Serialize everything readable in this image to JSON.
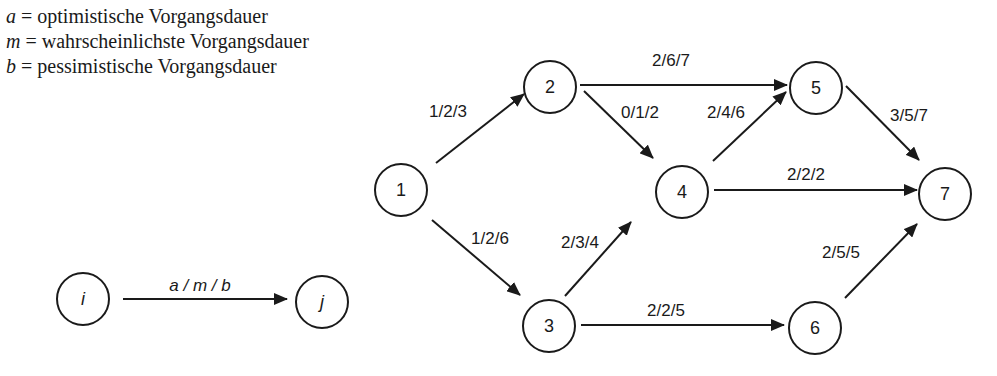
{
  "legend": [
    {
      "var": "a",
      "text": " = optimistische Vorgangsdauer"
    },
    {
      "var": "m",
      "text": " = wahrscheinlichste Vorgangsdauer"
    },
    {
      "var": "b",
      "text": " = pessimistische Vorgangsdauer"
    }
  ],
  "key": {
    "from": "i",
    "to": "j",
    "label": "a / m / b"
  },
  "nodes": [
    {
      "id": "1",
      "label": "1"
    },
    {
      "id": "2",
      "label": "2"
    },
    {
      "id": "3",
      "label": "3"
    },
    {
      "id": "4",
      "label": "4"
    },
    {
      "id": "5",
      "label": "5"
    },
    {
      "id": "6",
      "label": "6"
    },
    {
      "id": "7",
      "label": "7"
    }
  ],
  "edges": [
    {
      "from": "1",
      "to": "2",
      "label": "1/2/3"
    },
    {
      "from": "1",
      "to": "3",
      "label": "1/2/6"
    },
    {
      "from": "2",
      "to": "5",
      "label": "2/6/7"
    },
    {
      "from": "2",
      "to": "4",
      "label": "0/1/2"
    },
    {
      "from": "3",
      "to": "4",
      "label": "2/3/4"
    },
    {
      "from": "3",
      "to": "6",
      "label": "2/2/5"
    },
    {
      "from": "4",
      "to": "5",
      "label": "2/4/6"
    },
    {
      "from": "4",
      "to": "7",
      "label": "2/2/2"
    },
    {
      "from": "5",
      "to": "7",
      "label": "3/5/7"
    },
    {
      "from": "6",
      "to": "7",
      "label": "2/5/5"
    }
  ],
  "colors": {
    "stroke": "#1a1a1a",
    "background": "#ffffff"
  }
}
